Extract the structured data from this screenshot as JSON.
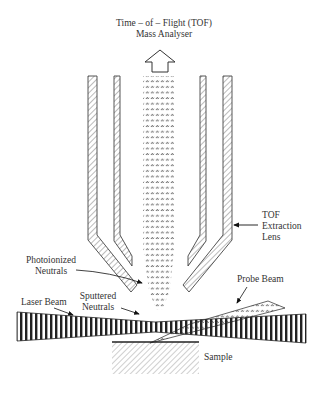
{
  "figure": {
    "type": "schematic",
    "colors": {
      "ink": "#222222",
      "text": "#333333",
      "hatch": "#666666",
      "background": "#ffffff"
    }
  },
  "labels": {
    "analyser_line1": "Time – of – Flight (TOF)",
    "analyser_line2": "Mass Analyser",
    "lens_line1": "TOF",
    "lens_line2": "Extraction",
    "lens_line3": "Lens",
    "photoionized_line1": "Photoionized",
    "photoionized_line2": "Neutrals",
    "sputtered_line1": "Sputtered",
    "sputtered_line2": "Neutrals",
    "laser_beam": "Laser Beam",
    "probe_beam": "Probe Beam",
    "sample": "Sample"
  },
  "components": [
    {
      "id": "tof-analyser",
      "name": "Time-of-Flight (TOF) Mass Analyser",
      "depiction": "upward hollow arrow"
    },
    {
      "id": "extraction-lens",
      "name": "TOF Extraction Lens",
      "depiction": "two pairs of hatched electrodes"
    },
    {
      "id": "ion-column",
      "name": "Photoionized Neutrals",
      "depiction": "dotted column"
    },
    {
      "id": "sputtered",
      "name": "Sputtered Neutrals",
      "depiction": "dotted plume above sample"
    },
    {
      "id": "laser-beam",
      "name": "Laser Beam",
      "depiction": "horizontal striped bow-tie beam"
    },
    {
      "id": "probe-beam",
      "name": "Probe Beam",
      "depiction": "dotted incoming wedge"
    },
    {
      "id": "sample",
      "name": "Sample",
      "depiction": "hatched block"
    }
  ]
}
